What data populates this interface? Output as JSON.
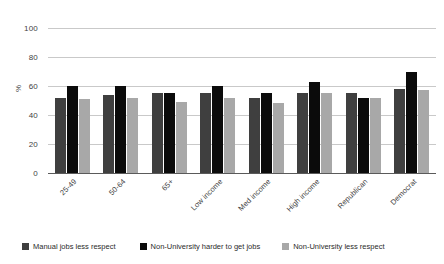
{
  "chart_data": {
    "type": "bar",
    "title": "",
    "subtitle": "",
    "xlabel": "",
    "ylabel": "%",
    "ylim": [
      0,
      100
    ],
    "ytick_labels": [
      "100",
      "80",
      "60",
      "40",
      "20",
      "0"
    ],
    "yticks": [
      100,
      80,
      60,
      40,
      20,
      0
    ],
    "grid": true,
    "legend_position": "bottom",
    "categories": [
      "25-49",
      "50-64",
      "65+",
      "Low income",
      "Med income",
      "High income",
      "Republican",
      "Democrat"
    ],
    "series": [
      {
        "name": "Manual jobs less respect",
        "color": "#3f3f3f",
        "values": [
          52,
          54,
          55,
          55,
          52,
          55,
          55,
          58
        ]
      },
      {
        "name": "Non-University harder to get jobs",
        "color": "#0b0b0b",
        "values": [
          60,
          60,
          55,
          60,
          55,
          63,
          52,
          70
        ]
      },
      {
        "name": "Non-University less respect",
        "color": "#a8a8a8",
        "values": [
          51,
          52,
          49,
          52,
          48,
          55,
          52,
          57
        ]
      }
    ]
  },
  "axes": {
    "y_title": "%"
  },
  "legend": {
    "items": [
      {
        "label": "Manual jobs less respect",
        "color": "#3f3f3f"
      },
      {
        "label": "Non-University harder to get jobs",
        "color": "#0b0b0b"
      },
      {
        "label": "Non-University less respect",
        "color": "#a8a8a8"
      }
    ]
  }
}
